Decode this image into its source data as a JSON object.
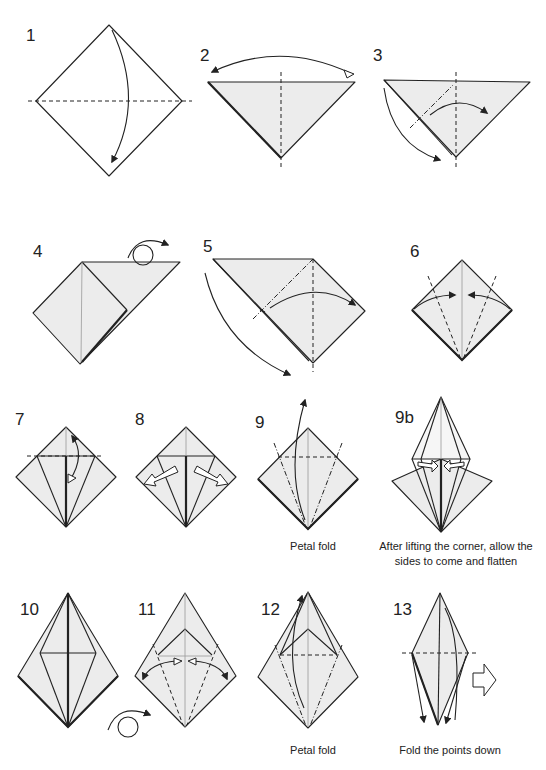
{
  "diagram": {
    "steps": [
      {
        "number": "1",
        "caption": ""
      },
      {
        "number": "2",
        "caption": ""
      },
      {
        "number": "3",
        "caption": ""
      },
      {
        "number": "4",
        "caption": ""
      },
      {
        "number": "5",
        "caption": ""
      },
      {
        "number": "6",
        "caption": ""
      },
      {
        "number": "7",
        "caption": ""
      },
      {
        "number": "8",
        "caption": ""
      },
      {
        "number": "9",
        "caption": "Petal fold"
      },
      {
        "number": "9b",
        "caption_line1": "After lifting the corner, allow the",
        "caption_line2": "sides to come and flatten"
      },
      {
        "number": "10",
        "caption": ""
      },
      {
        "number": "11",
        "caption": ""
      },
      {
        "number": "12",
        "caption": "Petal fold"
      },
      {
        "number": "13",
        "caption": "Fold the points down"
      }
    ],
    "legend": {
      "valley_fold": "dashed line",
      "mountain_fold": "dash-dot line",
      "turn_over": "loop arrow",
      "next_step": "hollow right arrow"
    },
    "colors": {
      "paper": "#ececec",
      "line": "#222222",
      "background": "#ffffff"
    }
  }
}
